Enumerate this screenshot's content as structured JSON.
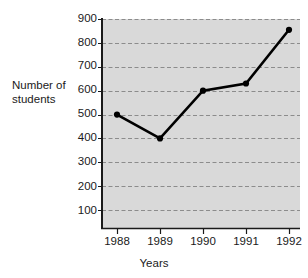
{
  "chart_data": {
    "type": "line",
    "title": "",
    "xlabel": "Years",
    "ylabel": "Number of\nstudents",
    "categories": [
      "1988",
      "1989",
      "1990",
      "1991",
      "1992"
    ],
    "values": [
      500,
      400,
      600,
      630,
      855
    ],
    "series": [
      {
        "name": "Number of students",
        "values": [
          500,
          400,
          600,
          630,
          855
        ]
      }
    ],
    "ylim": [
      0,
      900
    ],
    "y_ticks": [
      100,
      200,
      300,
      400,
      500,
      600,
      700,
      800,
      900
    ],
    "y_tick_labels": [
      "100",
      "200",
      "300",
      "400",
      "500",
      "600",
      "700",
      "800",
      "900"
    ],
    "x_tick_labels": [
      "1988",
      "1989",
      "1990",
      "1991",
      "1992"
    ],
    "grid": true,
    "grid_style": "dashed-horizontal",
    "legend": "none",
    "plot_background_color": "#d9d9d9",
    "line_color": "#000000",
    "marker_color": "#000000",
    "marker_shape": "circle",
    "gridline_color": "#8c8c8c",
    "axis_color": "#1a1a1a",
    "page_background_color": "#ffffff"
  },
  "labels": {
    "y_axis_title": "Number of\nstudents",
    "x_axis_title": "Years"
  }
}
